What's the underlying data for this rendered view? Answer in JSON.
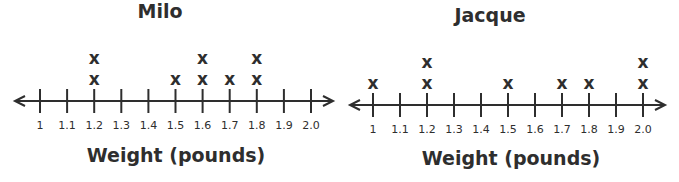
{
  "chart_data": [
    {
      "type": "dot_plot",
      "title": "Milo",
      "xlabel": "Weight (pounds)",
      "ylabel": "",
      "marker": "X",
      "xlim": [
        1.0,
        2.0
      ],
      "tick_labels": [
        "1",
        "1.1",
        "1.2",
        "1.3",
        "1.4",
        "1.5",
        "1.6",
        "1.7",
        "1.8",
        "1.9",
        "2.0"
      ],
      "categories": [
        1.0,
        1.1,
        1.2,
        1.3,
        1.4,
        1.5,
        1.6,
        1.7,
        1.8,
        1.9,
        2.0
      ],
      "values": [
        0,
        0,
        2,
        0,
        0,
        1,
        2,
        1,
        2,
        0,
        0
      ],
      "grid": false
    },
    {
      "type": "dot_plot",
      "title": "Jacque",
      "xlabel": "Weight (pounds)",
      "ylabel": "",
      "marker": "X",
      "xlim": [
        1.0,
        2.0
      ],
      "tick_labels": [
        "1",
        "1.1",
        "1.2",
        "1.3",
        "1.4",
        "1.5",
        "1.6",
        "1.7",
        "1.8",
        "1.9",
        "2.0"
      ],
      "categories": [
        1.0,
        1.1,
        1.2,
        1.3,
        1.4,
        1.5,
        1.6,
        1.7,
        1.8,
        1.9,
        2.0
      ],
      "values": [
        1,
        0,
        2,
        0,
        0,
        1,
        0,
        1,
        1,
        0,
        2
      ],
      "grid": false
    }
  ],
  "plots": {
    "milo": {
      "title": "Milo",
      "xlabel": "Weight (pounds)"
    },
    "jacque": {
      "title": "Jacque",
      "xlabel": "Weight (pounds)"
    }
  },
  "style": {
    "ink": "#2e2e2e",
    "background": "#ffffff"
  }
}
